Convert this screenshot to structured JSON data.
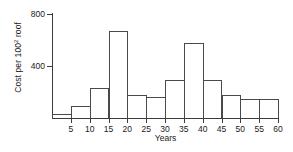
{
  "chart_data": {
    "type": "bar",
    "title": "",
    "xlabel": "Years",
    "ylabel_text": "Cost per 100",
    "ylabel_sup": "2",
    "ylabel_suffix": " roof",
    "ylabel_full": "Cost per 100² roof",
    "categories": [
      "0-5",
      "5-10",
      "10-15",
      "15-20",
      "20-25",
      "25-30",
      "30-35",
      "35-40",
      "40-45",
      "45-50",
      "50-55",
      "55-60"
    ],
    "bin_starts": [
      0,
      5,
      10,
      15,
      20,
      25,
      30,
      35,
      40,
      45,
      50,
      55
    ],
    "bin_width": 5,
    "values": [
      30,
      95,
      230,
      670,
      180,
      165,
      290,
      580,
      290,
      175,
      150,
      150
    ],
    "xlim": [
      0,
      60
    ],
    "ylim": [
      0,
      800
    ],
    "xticks": [
      5,
      10,
      15,
      20,
      25,
      30,
      35,
      40,
      45,
      50,
      55,
      60
    ],
    "xtick_labels": [
      "5",
      "10",
      "15",
      "20",
      "25",
      "30",
      "35",
      "40",
      "45",
      "50",
      "55",
      "60"
    ],
    "yticks": [
      400,
      800
    ],
    "ytick_labels": [
      "400",
      "800"
    ],
    "grid": false,
    "legend": false,
    "bar_edge_color": "#4a4a4a",
    "bar_fill_color": "transparent",
    "axis_color": "#3c3c3c"
  }
}
